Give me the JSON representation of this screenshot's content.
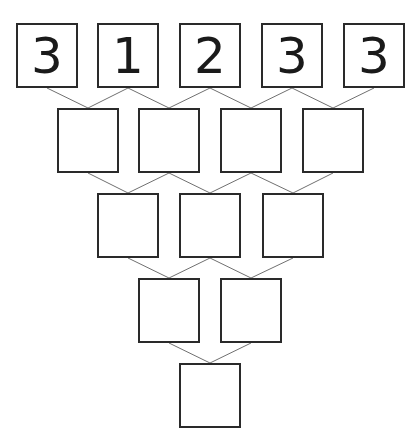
{
  "puzzle": {
    "rows": [
      [
        "3",
        "1",
        "2",
        "3",
        "3"
      ],
      [
        "",
        "",
        "",
        ""
      ],
      [
        "",
        "",
        ""
      ],
      [
        "",
        ""
      ],
      [
        ""
      ]
    ]
  },
  "colors": {
    "border": "#2a2a2a",
    "connector": "#707070",
    "digit": "#1a1a1a",
    "background": "#ffffff"
  }
}
